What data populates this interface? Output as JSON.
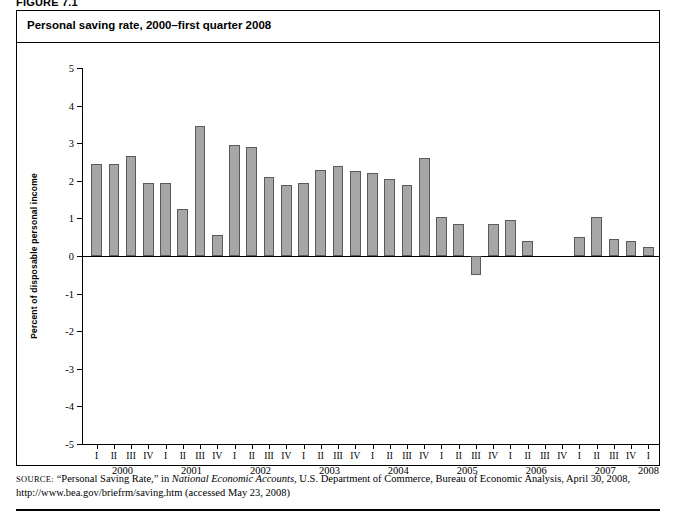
{
  "figure": {
    "label": "FIGURE 7.1",
    "title": "Personal saving rate, 2000–first quarter 2008"
  },
  "source": {
    "prefix": "SOURCE:",
    "line1_a": "“Personal Saving Rate,” in ",
    "line1_italic": "National Economic Accounts",
    "line1_b": ", U.S. Department of Commerce, Bureau of Economic Analysis, April 30, 2008,",
    "line2": "http://www.bea.gov/briefrm/saving.htm (accessed May 23, 2008)"
  },
  "chart_data": {
    "type": "bar",
    "title": "Personal saving rate, 2000–first quarter 2008",
    "xlabel": "",
    "ylabel": "Percent of disposable personal income",
    "ylim": [
      -5,
      5
    ],
    "ytick_labels": [
      "5",
      "4",
      "3",
      "2",
      "1",
      "0",
      "-1",
      "-2",
      "-3",
      "-4",
      "-5"
    ],
    "ytick_values": [
      5,
      4,
      3,
      2,
      1,
      0,
      -1,
      -2,
      -3,
      -4,
      -5
    ],
    "grid": false,
    "legend": "none",
    "bar_color": "#a6a6a6",
    "bar_edge_color": "#5a5a5a",
    "years": [
      "2000",
      "2001",
      "2002",
      "2003",
      "2004",
      "2005",
      "2006",
      "2007",
      "2008"
    ],
    "quarter_labels": [
      "I",
      "II",
      "III",
      "IV"
    ],
    "categories": [
      "2000 I",
      "2000 II",
      "2000 III",
      "2000 IV",
      "2001 I",
      "2001 II",
      "2001 III",
      "2001 IV",
      "2002 I",
      "2002 II",
      "2002 III",
      "2002 IV",
      "2003 I",
      "2003 II",
      "2003 III",
      "2003 IV",
      "2004 I",
      "2004 II",
      "2004 III",
      "2004 IV",
      "2005 I",
      "2005 II",
      "2005 III",
      "2005 IV",
      "2006 I",
      "2006 II",
      "2006 III",
      "2006 IV",
      "2007 I",
      "2007 II",
      "2007 III",
      "2007 IV",
      "2008 I"
    ],
    "values": [
      2.45,
      2.45,
      2.65,
      1.95,
      1.95,
      1.25,
      3.45,
      0.55,
      2.95,
      2.9,
      2.1,
      1.9,
      1.95,
      2.3,
      2.4,
      2.25,
      2.2,
      2.05,
      1.9,
      2.6,
      1.05,
      0.85,
      -0.5,
      0.85,
      0.95,
      0.4,
      0.0,
      0.0,
      0.5,
      1.05,
      0.45,
      0.4,
      0.25
    ]
  }
}
